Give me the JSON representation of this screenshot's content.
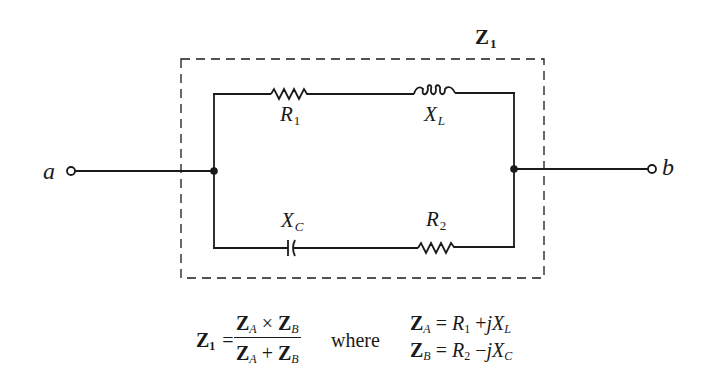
{
  "diagram": {
    "type": "parallel impedance circuit",
    "box_label": {
      "base": "Z",
      "sub": "1"
    },
    "terminals": [
      {
        "id": "a",
        "label": "a"
      },
      {
        "id": "b",
        "label": "b"
      }
    ],
    "branches": [
      {
        "name": "upper",
        "components": [
          {
            "type": "resistor",
            "label": {
              "base": "R",
              "sub": "1"
            }
          },
          {
            "type": "inductor",
            "label": {
              "base": "X",
              "sub": "L"
            }
          }
        ]
      },
      {
        "name": "lower",
        "components": [
          {
            "type": "capacitor",
            "label": {
              "base": "X",
              "sub": "C"
            }
          },
          {
            "type": "resistor",
            "label": {
              "base": "R",
              "sub": "2"
            }
          }
        ]
      }
    ]
  },
  "formula": {
    "lhs": {
      "base": "Z",
      "sub": "1"
    },
    "equals": "=",
    "numerator": {
      "a": "Z",
      "a_sub": "A",
      "op": "×",
      "b": "Z",
      "b_sub": "B"
    },
    "denominator": {
      "a": "Z",
      "a_sub": "A",
      "op": "+",
      "b": "Z",
      "b_sub": "B"
    },
    "where": "where",
    "definitions": [
      {
        "lhs": "Z",
        "lhs_sub": "A",
        "eq": "=",
        "r": "R",
        "r_sub": "1",
        "op": "+",
        "j": "jX",
        "x_sub": "L"
      },
      {
        "lhs": "Z",
        "lhs_sub": "B",
        "eq": "=",
        "r": "R",
        "r_sub": "2",
        "op": "−",
        "j": "jX",
        "x_sub": "C"
      }
    ]
  },
  "colors": {
    "ink": "#1a1a1a",
    "background": "#ffffff"
  }
}
